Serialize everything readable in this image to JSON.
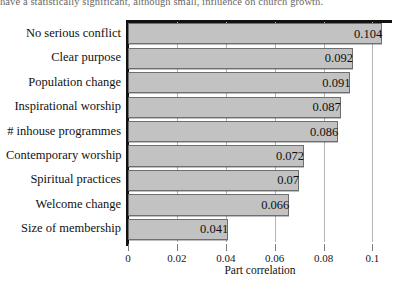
{
  "top_text": "have a statistically significant, although small, influence on church growth.",
  "chart_data": {
    "type": "bar",
    "orientation": "horizontal",
    "title": "",
    "xlabel": "Part correlation",
    "ylabel": "",
    "xlim": [
      0,
      0.108
    ],
    "xticks": [
      "0",
      "0.02",
      "0.04",
      "0.06",
      "0.08",
      "0.1"
    ],
    "xtick_values": [
      0,
      0.02,
      0.04,
      0.06,
      0.08,
      0.1
    ],
    "grid": "vertical",
    "legend": "none",
    "categories": [
      "No serious conflict",
      "Clear purpose",
      "Population change",
      "Inspirational worship",
      "# inhouse programmes",
      "Contemporary worship",
      "Spiritual practices",
      "Welcome change",
      "Size of membership"
    ],
    "values": [
      0.104,
      0.092,
      0.091,
      0.087,
      0.086,
      0.072,
      0.07,
      0.066,
      0.041
    ],
    "value_labels": [
      "0.104",
      "0.092",
      "0.091",
      "0.087",
      "0.086",
      "0.072",
      "0.07",
      "0.066",
      "0.041"
    ],
    "bar_fill": "#c2c2c2",
    "bar_stroke": "#6e6e6e",
    "axis_color": "#111111",
    "grid_color": "#b3b3b3"
  }
}
